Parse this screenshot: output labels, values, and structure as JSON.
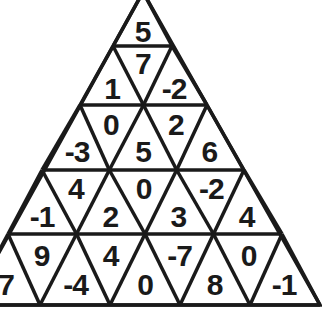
{
  "puzzle": {
    "title": "Triangle number puzzle",
    "line_color": "#1a1a1a",
    "rows": [
      [
        "5"
      ],
      [
        "1",
        "7",
        "-2"
      ],
      [
        "-3",
        "0",
        "5",
        "2",
        "6"
      ],
      [
        "-1",
        "4",
        "2",
        "0",
        "3",
        "-2",
        "4"
      ],
      [
        "7",
        "9",
        "-4",
        "4",
        "0",
        "-7",
        "8",
        "0",
        "-1"
      ]
    ]
  }
}
